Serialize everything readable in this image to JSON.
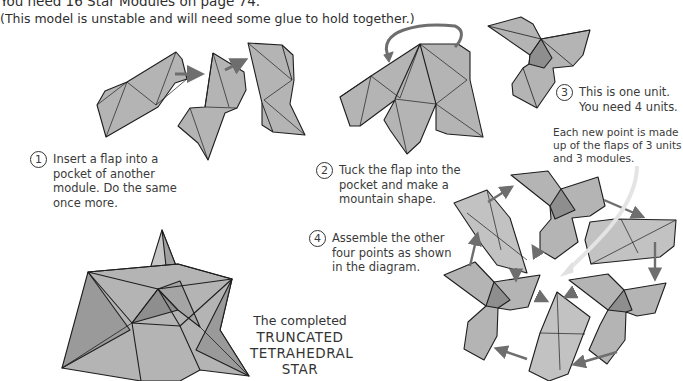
{
  "intro": {
    "line1": "You need 16 Star Modules on page 74.",
    "line2": "(This model is unstable and will need some glue to hold together.)"
  },
  "steps": [
    {
      "number": "1",
      "lines": [
        "Insert a flap into a",
        "pocket of another",
        "module. Do the same",
        "once more."
      ]
    },
    {
      "number": "2",
      "lines": [
        "Tuck the flap into the",
        "pocket and make a",
        "mountain shape."
      ]
    },
    {
      "number": "3",
      "lines": [
        "This is one unit.",
        "You need 4 units."
      ]
    },
    {
      "number": "4",
      "lines": [
        "Assemble the other",
        "four points as shown",
        "in the diagram."
      ]
    }
  ],
  "annotation": {
    "lines": [
      "Each new point is made",
      "up of the flaps of 3 units",
      "and 3 modules."
    ]
  },
  "completed": {
    "caption": "The completed",
    "title_lines": [
      "TRUNCATED",
      "TETRAHEDRAL",
      "STAR"
    ]
  },
  "colors": {
    "paper": "#b4b4b4",
    "paper_light": "#c6c6c6",
    "paper_dark": "#8e8e8e",
    "outline": "#1e1e1e",
    "arrow": "#6e6e6e"
  }
}
